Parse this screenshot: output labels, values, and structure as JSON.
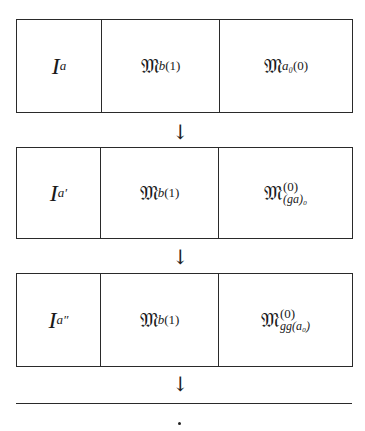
{
  "rows": [
    {
      "col1": {
        "base": "I",
        "sub": "a"
      },
      "col2": {
        "base": "𝔐",
        "sub": "b",
        "sup": "(1)"
      },
      "col3": {
        "base": "𝔐",
        "sub": "a₀",
        "sup": "(0)"
      }
    },
    {
      "col1": {
        "base": "I",
        "sub": "a′"
      },
      "col2": {
        "base": "𝔐",
        "sub": "b",
        "sup": "(1)"
      },
      "col3": {
        "base": "𝔐",
        "sub": "(ga)₀",
        "sup": "(0)"
      }
    },
    {
      "col1": {
        "base": "I",
        "sub": "a″"
      },
      "col2": {
        "base": "𝔐",
        "sub": "b",
        "sup": "(1)"
      },
      "col3": {
        "base": "𝔐",
        "sub": "gg(a₀)",
        "sup": "(0)"
      }
    }
  ],
  "arrow": "↓",
  "continuation": "·"
}
